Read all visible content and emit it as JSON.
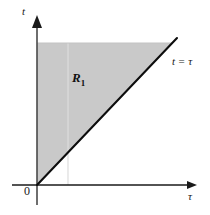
{
  "figure": {
    "kind": "math-diagram",
    "width": 210,
    "height": 215,
    "background_color": "#ffffff"
  },
  "axes": {
    "vertical": {
      "label": "t",
      "name": "t-axis",
      "color": "#1a1a1a",
      "x": 37,
      "y_top": 16,
      "y_bottom": 205,
      "arrow": "up"
    },
    "horizontal": {
      "label": "τ",
      "name": "tau-axis",
      "color": "#1a1a1a",
      "y": 185,
      "x_left": 12,
      "x_right": 197,
      "arrow": "right"
    },
    "origin": {
      "label": "0",
      "x": 37,
      "y": 185
    }
  },
  "region": {
    "label": "R",
    "subscript": "1",
    "fill_color": "#c9c9c9",
    "description": "shaded triangular region R1",
    "vertices": [
      {
        "x": 37,
        "y": 43
      },
      {
        "x": 172,
        "y": 43
      },
      {
        "x": 37,
        "y": 185
      }
    ]
  },
  "boundary_line": {
    "equation_t": "t",
    "equation_eq": "=",
    "equation_tau": "τ",
    "label": "t = τ",
    "color": "#0d0d0d",
    "from": {
      "x": 37,
      "y": 185
    },
    "to": {
      "x": 177,
      "y": 38
    }
  },
  "guide_line": {
    "name": "faint-vertical-guide",
    "x": 68,
    "y_top": 43,
    "y_bottom": 185,
    "color": "#dcdcdc"
  }
}
